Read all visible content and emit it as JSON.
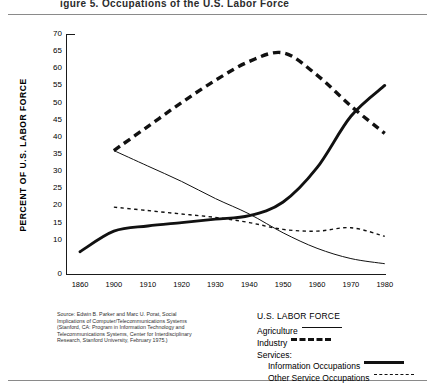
{
  "figure": {
    "title_partial": "igure 5.    Occupations of the U.S. Labor Force"
  },
  "axes": {
    "ylabel": "PERCENT OF U.S. LABOR FORCE",
    "yticks": [
      "70",
      "65",
      "60",
      "55",
      "50",
      "45",
      "40",
      "35",
      "30",
      "25",
      "20",
      "15",
      "10",
      "0"
    ],
    "xticks": [
      "1860",
      "1900",
      "1910",
      "1920",
      "1930",
      "1940",
      "1950",
      "1960",
      "1970",
      "1980"
    ]
  },
  "source": {
    "text": "Source: Edwin B. Parker and Marc U. Porat, Social Implications of Computer/Telecommunications Systems (Stanford, CA: Program in Information Technology and Telecommunications Systems, Center for Interdisciplinary Research, Stanford University, February 1975.)"
  },
  "legend": {
    "title": "U.S. LABOR FORCE",
    "agriculture": "Agriculture",
    "industry": "Industry",
    "services": "Services:",
    "information": "Information Occupations",
    "other_service": "Other Service Occupations"
  },
  "colors": {
    "ink": "#111111",
    "rule": "#8a8a8a",
    "background": "#ffffff"
  },
  "chart_data": {
    "type": "line",
    "title": "Occupations of the U.S. Labor Force",
    "xlabel": "",
    "ylabel": "PERCENT OF U.S. LABOR FORCE",
    "xlim": [
      1860,
      1980
    ],
    "ylim": [
      0,
      70
    ],
    "grid": false,
    "legend_position": "bottom-right",
    "x_tick_values": [
      1860,
      1900,
      1910,
      1920,
      1930,
      1940,
      1950,
      1960,
      1970,
      1980
    ],
    "y_tick_values": [
      0,
      10,
      15,
      20,
      25,
      30,
      35,
      40,
      45,
      50,
      55,
      60,
      65,
      70
    ],
    "note": "x axis is compressed between 1860 and 1900: the 1860-1900 interval occupies the same width as each later decade",
    "series": [
      {
        "name": "Agriculture",
        "style": "thin-solid",
        "x": [
          1900,
          1910,
          1920,
          1930,
          1940,
          1950,
          1960,
          1970,
          1980
        ],
        "values": [
          36,
          31.5,
          27,
          22,
          17.5,
          12,
          7.5,
          4.5,
          3
        ]
      },
      {
        "name": "Industry",
        "style": "thick-dashed",
        "x": [
          1900,
          1910,
          1920,
          1930,
          1940,
          1950,
          1960,
          1970,
          1980
        ],
        "values": [
          36,
          43,
          50,
          56.5,
          62,
          64.5,
          58,
          49,
          41
        ]
      },
      {
        "name": "Information Occupations",
        "style": "thick-solid",
        "x": [
          1860,
          1900,
          1910,
          1920,
          1930,
          1940,
          1950,
          1960,
          1970,
          1980
        ],
        "values": [
          6.5,
          12.5,
          14,
          15,
          16,
          17,
          21,
          31,
          46,
          55
        ]
      },
      {
        "name": "Other Service Occupations",
        "style": "thin-dashed",
        "x": [
          1900,
          1910,
          1920,
          1930,
          1940,
          1950,
          1960,
          1970,
          1980
        ],
        "values": [
          19.5,
          18.5,
          17.5,
          16.5,
          15,
          13,
          12.5,
          13.5,
          11
        ]
      }
    ]
  }
}
